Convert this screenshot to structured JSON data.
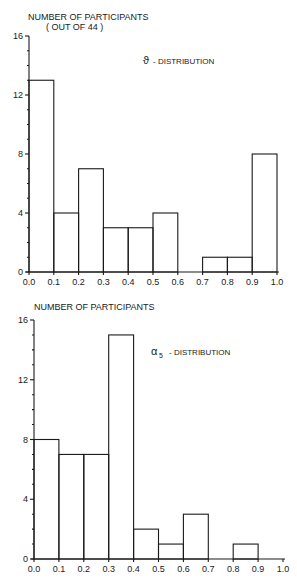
{
  "chart_data": [
    {
      "type": "bar",
      "title": "ϑ - DISTRIBUTION",
      "ylabel": "NUMBER OF PARTICIPANTS",
      "ylabel_sub": "(OUT OF 44)",
      "xlabel": "",
      "bin_edges": [
        0.0,
        0.1,
        0.2,
        0.3,
        0.4,
        0.5,
        0.6,
        0.7,
        0.8,
        0.9,
        1.0
      ],
      "categories": [
        "0.0-0.1",
        "0.1-0.2",
        "0.2-0.3",
        "0.3-0.4",
        "0.4-0.5",
        "0.5-0.6",
        "0.6-0.7",
        "0.7-0.8",
        "0.8-0.9",
        "0.9-1.0"
      ],
      "values": [
        13,
        4,
        7,
        3,
        3,
        4,
        0,
        1,
        1,
        8
      ],
      "xticks": [
        "0.0",
        "0.1",
        "0.2",
        "0.3",
        "0.4",
        "0.5",
        "0.6",
        "0.7",
        "0.8",
        "0.9",
        "1.0"
      ],
      "yticks": [
        "0",
        "4",
        "8",
        "12",
        "16"
      ],
      "ylim": [
        0,
        16
      ],
      "xlim": [
        0,
        1
      ],
      "grid": false
    },
    {
      "type": "bar",
      "title": "α5 - DISTRIBUTION",
      "ylabel": "NUMBER OF PARTICIPANTS",
      "xlabel": "",
      "bin_edges": [
        0.0,
        0.1,
        0.2,
        0.3,
        0.4,
        0.5,
        0.6,
        0.7,
        0.8,
        0.9,
        1.0
      ],
      "categories": [
        "0.0-0.1",
        "0.1-0.2",
        "0.2-0.3",
        "0.3-0.4",
        "0.4-0.5",
        "0.5-0.6",
        "0.6-0.7",
        "0.7-0.8",
        "0.8-0.9",
        "0.9-1.0"
      ],
      "values": [
        8,
        7,
        7,
        15,
        2,
        1,
        3,
        0,
        1,
        0
      ],
      "xticks": [
        "0.0",
        "0.1",
        "0.2",
        "0.3",
        "0.4",
        "0.5",
        "0.6",
        "0.7",
        "0.8",
        "0.9",
        "1.0"
      ],
      "yticks": [
        "0",
        "4",
        "8",
        "12",
        "16"
      ],
      "ylim": [
        0,
        16
      ],
      "xlim": [
        0,
        1
      ],
      "grid": false
    }
  ],
  "charts": [
    {
      "ylabel": "NUMBER OF PARTICIPANTS",
      "ylabel_sub": "( OUT OF 44 )",
      "legend_symbol": "ϑ",
      "legend_text": "- DISTRIBUTION"
    },
    {
      "ylabel": "NUMBER OF PARTICIPANTS",
      "legend_symbol": "α",
      "legend_sub": "5",
      "legend_text": "- DISTRIBUTION"
    }
  ]
}
